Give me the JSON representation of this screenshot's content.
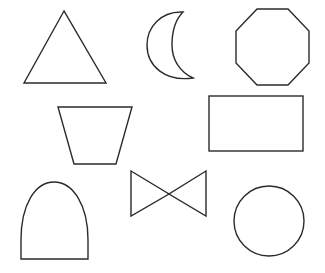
{
  "stroke_color": "#2b2b2b",
  "background_color": "#ffffff",
  "shapes": [
    {
      "name": "triangle",
      "label": "Triangle",
      "row": 1,
      "col": 1
    },
    {
      "name": "crescent-moon",
      "label": "Crescent moon",
      "row": 1,
      "col": 2
    },
    {
      "name": "octagon",
      "label": "Octagon",
      "row": 1,
      "col": 3
    },
    {
      "name": "trapezoid",
      "label": "Trapezoid",
      "row": 2,
      "col": 1
    },
    {
      "name": "rectangle",
      "label": "Rectangle",
      "row": 2,
      "col": 2
    },
    {
      "name": "arch",
      "label": "Arch",
      "row": 3,
      "col": 1
    },
    {
      "name": "bowtie",
      "label": "Bowtie",
      "row": 3,
      "col": 2
    },
    {
      "name": "circle",
      "label": "Circle",
      "row": 3,
      "col": 3
    }
  ]
}
